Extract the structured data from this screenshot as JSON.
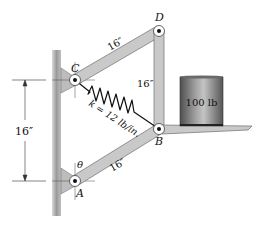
{
  "figure": {
    "type": "mechanism-diagram",
    "points": {
      "A": {
        "label": "A",
        "x": 75,
        "y": 181
      },
      "B": {
        "label": "B",
        "x": 159,
        "y": 129
      },
      "C": {
        "label": "C",
        "x": 75,
        "y": 80
      },
      "D": {
        "label": "D",
        "x": 159,
        "y": 31
      }
    },
    "members": [
      {
        "from": "C",
        "to": "D",
        "length_label": "16″"
      },
      {
        "from": "D",
        "to": "B",
        "length_label": "16″"
      },
      {
        "from": "A",
        "to": "B",
        "length_label": "16″"
      }
    ],
    "spring": {
      "from": "C",
      "to": "B",
      "label": "k = 12 lb/in."
    },
    "angle": {
      "label": "θ",
      "at": "A"
    },
    "dimension": {
      "label": "16″",
      "between": [
        "C",
        "A"
      ]
    },
    "load": {
      "label": "100 lb"
    },
    "colors": {
      "member_fill": "#c9c9c9",
      "member_edge": "#6e6e6e",
      "wall": "#a8a8a8",
      "load_dark": "#5a5a5a",
      "load_light": "#bdbdbd"
    }
  }
}
